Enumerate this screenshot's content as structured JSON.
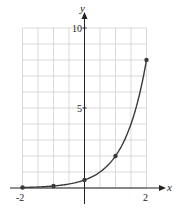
{
  "chart_data": {
    "type": "line",
    "title": "",
    "xlabel": "x",
    "ylabel": "y",
    "function": "y = 0.5 * 4^x",
    "x_tick_labels": [
      "-2",
      "2"
    ],
    "y_tick_labels": [
      "5",
      "10"
    ],
    "xlim": [
      -2,
      2
    ],
    "ylim": [
      0,
      10
    ],
    "grid": true,
    "grid_x_step": 0.5,
    "grid_y_step": 1,
    "points": [
      {
        "x": -2,
        "y": 0.03125
      },
      {
        "x": -1,
        "y": 0.125
      },
      {
        "x": 0,
        "y": 0.5
      },
      {
        "x": 1,
        "y": 2
      },
      {
        "x": 2,
        "y": 8
      }
    ],
    "colors": {
      "curve": "#3a3a3a",
      "grid": "#cfcfcf",
      "axis": "#222222"
    }
  }
}
